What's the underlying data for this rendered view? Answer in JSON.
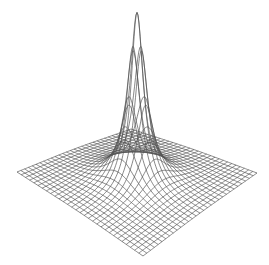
{
  "chart_data": {
    "type": "surface-wireframe",
    "title": "",
    "xlabel": "",
    "ylabel": "",
    "zlabel": "",
    "grid": false,
    "legend": null,
    "surface": {
      "function": "z = A / (1 + k*(x^2 + y^2))",
      "A": 1.0,
      "k": 60,
      "x_range": [
        -1,
        1
      ],
      "y_range": [
        -1,
        1
      ],
      "grid_lines": 31,
      "peak": {
        "x": 0,
        "y": 0,
        "z": 1.0
      },
      "baseline_z": 0
    },
    "projection": {
      "left_corner": [
        17,
        172
      ],
      "right_corner": [
        257,
        173
      ],
      "back_corner": [
        131,
        129
      ],
      "front_corner": [
        143,
        256
      ],
      "peak_screen": [
        141,
        7
      ]
    },
    "style": {
      "line_color": "#555555",
      "line_width": 0.7,
      "background": "#ffffff"
    }
  }
}
